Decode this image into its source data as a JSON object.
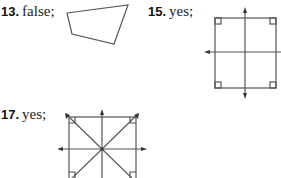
{
  "items": [
    {
      "number": "13.",
      "answer": "false;",
      "figure": "quadrilateral-no-symmetry"
    },
    {
      "number": "15.",
      "answer": "yes;",
      "figure": "rectangle-two-lines-of-symmetry"
    },
    {
      "number": "17.",
      "answer": "yes;",
      "figure": "square-four-lines-of-symmetry"
    }
  ]
}
